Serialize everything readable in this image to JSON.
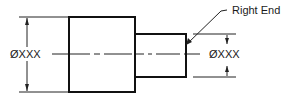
{
  "diagram": {
    "type": "engineering-drawing",
    "colors": {
      "line": "#111111",
      "background": "#ffffff"
    },
    "large_section": {
      "dimension_label": "ØXXX"
    },
    "small_section": {
      "dimension_label": "ØXXX"
    },
    "callout": {
      "label": "Right End"
    }
  }
}
